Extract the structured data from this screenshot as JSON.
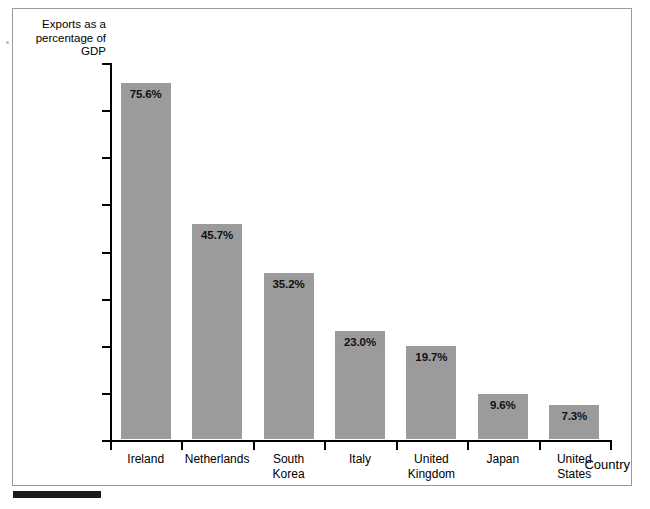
{
  "chart_data": {
    "type": "bar",
    "title": "",
    "subtitle": "",
    "ylabel": "Exports as a\npercentage\nof GDP",
    "xlabel": "Country",
    "categories": [
      "Ireland",
      "Netherlands",
      "South\nKorea",
      "Italy",
      "United\nKingdom",
      "Japan",
      "United\nStates"
    ],
    "values": [
      75.6,
      45.7,
      35.2,
      23.0,
      19.7,
      9.6,
      7.3
    ],
    "value_labels": [
      "75.6%",
      "45.7%",
      "35.2%",
      "23.0%",
      "19.7%",
      "9.6%",
      "7.3%"
    ],
    "ylim": [
      0,
      80
    ],
    "yticks": [
      0,
      10,
      20,
      30,
      40,
      50,
      60,
      70,
      80
    ],
    "ytick_labels": [
      "0",
      "10",
      "20",
      "30",
      "40",
      "50",
      "60",
      "70",
      "80"
    ],
    "grid": false,
    "legend": null,
    "bar_color": "#9b9b9b",
    "axis_color": "#000000",
    "frame_color": "#9a9a9a",
    "background": "#ffffff"
  }
}
